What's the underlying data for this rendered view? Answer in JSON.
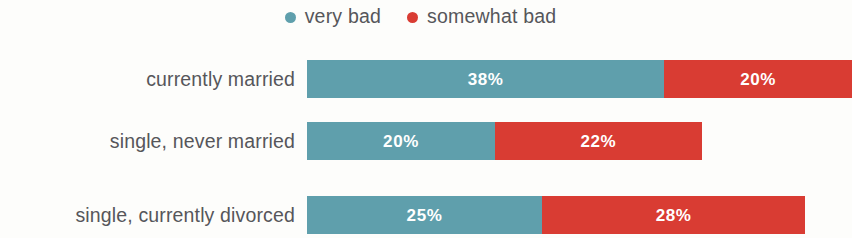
{
  "chart_data": {
    "type": "bar",
    "orientation": "horizontal",
    "stacked": true,
    "title": "",
    "subtitle": "",
    "xlabel": "",
    "ylabel": "",
    "grid": false,
    "legend_position": "top-center",
    "value_suffix": "%",
    "px_per_percent": 9.4,
    "bar_origin_x": 307,
    "categories": [
      "currently married",
      "single, never married",
      "single, currently divorced"
    ],
    "series": [
      {
        "name": "very bad",
        "color": "#5f9fac",
        "values": [
          38,
          20,
          25
        ],
        "labels": [
          "38%",
          "20%",
          "25%"
        ]
      },
      {
        "name": "somewhat bad",
        "color": "#d93c33",
        "values": [
          20,
          22,
          28
        ],
        "labels": [
          "20%",
          "22%",
          "28%"
        ]
      }
    ],
    "rows": [
      {
        "category": "currently married",
        "segments": [
          {
            "series": "very bad",
            "value": 38,
            "label": "38%",
            "color": "#5f9fac"
          },
          {
            "series": "somewhat bad",
            "value": 20,
            "label": "20%",
            "color": "#d93c33"
          }
        ]
      },
      {
        "category": "single, never married",
        "segments": [
          {
            "series": "very bad",
            "value": 20,
            "label": "20%",
            "color": "#5f9fac"
          },
          {
            "series": "somewhat bad",
            "value": 22,
            "label": "22%",
            "color": "#d93c33"
          }
        ]
      },
      {
        "category": "single, currently divorced",
        "segments": [
          {
            "series": "very bad",
            "value": 25,
            "label": "25%",
            "color": "#5f9fac"
          },
          {
            "series": "somewhat bad",
            "value": 28,
            "label": "28%",
            "color": "#d93c33"
          }
        ]
      }
    ]
  },
  "legend": {
    "items": [
      {
        "label": "very bad",
        "color": "#5f9fac",
        "marker": "circle-dot-icon"
      },
      {
        "label": "somewhat bad",
        "color": "#d93c33",
        "marker": "circle-dot-icon"
      }
    ]
  },
  "colors": {
    "background": "#fdfdfb",
    "label_text": "#56565a",
    "value_text": "#ffffff",
    "very_bad": "#5f9fac",
    "somewhat_bad": "#d93c33"
  }
}
